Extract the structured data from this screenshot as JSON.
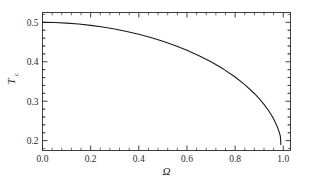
{
  "chart_data": {
    "type": "line",
    "title": "",
    "xlabel": "Ω",
    "ylabel": "T",
    "ylabel_sub": "c",
    "xlim": [
      0.0,
      1.03
    ],
    "ylim": [
      0.175,
      0.525
    ],
    "grid": false,
    "legend": null,
    "xticks": [
      0.0,
      0.2,
      0.4,
      0.6,
      0.8,
      1.0
    ],
    "xticklabels": [
      "0.0",
      "0.2",
      "0.4",
      "0.6",
      "0.8",
      "1.0"
    ],
    "yticks": [
      0.2,
      0.3,
      0.4,
      0.5
    ],
    "yticklabels": [
      "0.2",
      "0.3",
      "0.4",
      "0.5"
    ],
    "minor_ticks_per_interval": 4,
    "tick_direction": "in",
    "frame": true,
    "line_color": "#1a1a1a",
    "line_width": 1.1,
    "background": "#ffffff",
    "series": [
      {
        "name": "Tc",
        "x": [
          0.0,
          0.05,
          0.1,
          0.15,
          0.2,
          0.25,
          0.3,
          0.35,
          0.4,
          0.45,
          0.5,
          0.55,
          0.6,
          0.65,
          0.7,
          0.75,
          0.8,
          0.84,
          0.88,
          0.9,
          0.92,
          0.94,
          0.95,
          0.96,
          0.97,
          0.975,
          0.98,
          0.985,
          0.988,
          0.99
        ],
        "y": [
          0.5,
          0.4995,
          0.498,
          0.4957,
          0.4924,
          0.4882,
          0.483,
          0.4769,
          0.4697,
          0.4614,
          0.4519,
          0.4412,
          0.4291,
          0.4154,
          0.3999,
          0.3821,
          0.3613,
          0.3421,
          0.3196,
          0.3066,
          0.292,
          0.2752,
          0.2656,
          0.2549,
          0.2425,
          0.2353,
          0.2272,
          0.2176,
          0.2105,
          0.19
        ]
      }
    ]
  },
  "figure": {
    "axis_color": "#2b2b2b",
    "omega_symbol": "Ω"
  }
}
